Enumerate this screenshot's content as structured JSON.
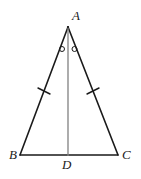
{
  "figure": {
    "kind": "geometry-diagram",
    "shape": "isosceles-triangle-with-median",
    "background_color": "#ffffff",
    "canvas": {
      "width": 141,
      "height": 179
    }
  },
  "labels": {
    "apex": "A",
    "bottom_left": "B",
    "bottom_right": "C",
    "base_midpoint": "D"
  },
  "points": {
    "A": {
      "x": 68,
      "y": 27
    },
    "B": {
      "x": 20,
      "y": 155
    },
    "C": {
      "x": 118,
      "y": 155
    },
    "D": {
      "x": 68,
      "y": 155
    }
  },
  "segments": [
    {
      "name": "AB",
      "from": "A",
      "to": "B",
      "color": "#1a1a1a",
      "width": 1.6
    },
    {
      "name": "AC",
      "from": "A",
      "to": "C",
      "color": "#1a1a1a",
      "width": 1.6
    },
    {
      "name": "BC",
      "from": "B",
      "to": "C",
      "color": "#1a1a1a",
      "width": 1.4
    },
    {
      "name": "AD",
      "from": "A",
      "to": "D",
      "color": "#808080",
      "width": 1.3
    }
  ],
  "congruence_ticks": [
    {
      "name": "tick-AB",
      "x": 44,
      "y": 91,
      "segment": "AB"
    },
    {
      "name": "tick-AC",
      "x": 93,
      "y": 91,
      "segment": "AC"
    }
  ],
  "angle_marks": [
    {
      "name": "angle-BAD",
      "x": 62,
      "y": 49,
      "glyph": "circle"
    },
    {
      "name": "angle-DAC",
      "x": 74,
      "y": 49,
      "glyph": "circle"
    }
  ],
  "colors": {
    "stroke": "#1a1a1a",
    "median": "#808080",
    "text": "#1a1a1a",
    "background": "#ffffff"
  }
}
